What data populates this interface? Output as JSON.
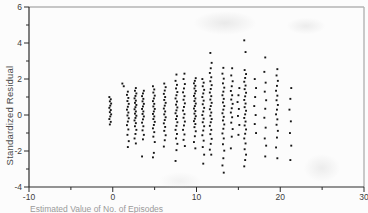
{
  "figure": {
    "bg": "#fcfcfc",
    "frame_color": "#b4b4b4",
    "axis_color": "#2a2a2a",
    "point_color": "#161616",
    "tick_label_color": "#3c3c3c"
  },
  "chart_data": {
    "type": "scatter",
    "title": "",
    "xlabel": "Estimated Value of No. of Episodes",
    "ylabel": "Standardized Residual",
    "xlim": [
      -10,
      30
    ],
    "ylim": [
      -4,
      6
    ],
    "x_major_ticks": [
      -10,
      0,
      10,
      20,
      30
    ],
    "x_minor_ticks": [
      -5,
      5,
      15,
      25
    ],
    "y_major_ticks": [
      6,
      4,
      2,
      0,
      -2,
      -4
    ],
    "y_minor_ticks": [
      5,
      3,
      1,
      -1,
      -3
    ],
    "grid": false,
    "legend": null,
    "marker": "square",
    "strips": [
      {
        "x": -0.3,
        "ys": [
          1.0,
          0.88,
          0.76,
          0.64,
          0.52,
          0.4,
          0.28,
          0.16,
          0.04,
          -0.08,
          -0.22,
          -0.38,
          -0.52
        ]
      },
      {
        "x": 1.2,
        "ys": [
          1.75,
          1.6
        ]
      },
      {
        "x": 1.8,
        "ys": [
          1.3,
          1.12,
          0.95,
          0.78,
          0.62,
          0.46,
          0.3,
          0.14,
          -0.02,
          -0.18,
          -0.36,
          -0.56,
          -0.8,
          -1.1,
          -1.45,
          -1.78
        ]
      },
      {
        "x": 2.7,
        "ys": [
          1.5,
          1.35,
          1.2,
          1.06,
          0.93,
          0.8,
          0.68,
          0.56,
          0.44,
          0.32,
          0.2,
          0.08,
          -0.04,
          -0.16,
          -0.3,
          -0.45,
          -0.62,
          -0.82,
          -1.05,
          -1.3,
          -1.58
        ]
      },
      {
        "x": 3.6,
        "ys": [
          1.35,
          1.2,
          1.05,
          0.9,
          0.76,
          0.62,
          0.48,
          0.34,
          0.2,
          0.06,
          -0.08,
          -0.24,
          -0.42,
          -0.62,
          -0.85,
          -1.1,
          -1.35,
          -2.3
        ]
      },
      {
        "x": 4.9,
        "ys": [
          1.6,
          1.42,
          1.25,
          1.08,
          0.92,
          0.77,
          0.62,
          0.48,
          0.34,
          0.2,
          0.06,
          -0.08,
          -0.22,
          -0.38,
          -0.55,
          -0.74,
          -0.95,
          -1.2,
          -1.5,
          -2.1,
          -2.35
        ]
      },
      {
        "x": 6.2,
        "ys": [
          1.75,
          1.55,
          1.36,
          1.18,
          1.0,
          0.84,
          0.68,
          0.52,
          0.36,
          0.2,
          0.04,
          -0.12,
          -0.28,
          -0.46,
          -0.66,
          -0.88,
          -1.12,
          -1.4,
          -1.75
        ]
      },
      {
        "x": 7.6,
        "ys": [
          2.25,
          1.9,
          1.68,
          1.48,
          1.28,
          1.1,
          0.92,
          0.75,
          0.58,
          0.42,
          0.26,
          0.1,
          -0.06,
          -0.22,
          -0.4,
          -0.6,
          -0.82,
          -1.05,
          -1.3,
          -1.6,
          -1.95,
          -2.55
        ]
      },
      {
        "x": 8.5,
        "ys": [
          2.3,
          2.0,
          1.72,
          1.48,
          1.26,
          1.05,
          0.85,
          0.65,
          0.45,
          0.25,
          0.05,
          -0.15,
          -0.36,
          -0.58,
          -0.82,
          -1.08,
          -1.38,
          -1.72
        ]
      },
      {
        "x": 9.8,
        "ys": [
          2.05,
          1.9,
          1.76,
          1.62,
          1.48,
          1.34,
          1.2,
          1.06,
          0.92,
          0.78,
          0.64,
          0.5,
          0.36,
          0.22,
          0.08,
          -0.06,
          -0.2,
          -0.34,
          -0.5,
          -0.67,
          -0.9,
          -1.18,
          -1.5,
          -1.85
        ]
      },
      {
        "x": 10.8,
        "ys": [
          2.0,
          1.8,
          1.6,
          1.4,
          1.2,
          1.0,
          0.8,
          0.6,
          0.4,
          0.2,
          0.0,
          -0.2,
          -0.4,
          -0.62,
          -0.86,
          -1.12,
          -1.42,
          -1.78,
          -2.2,
          -2.7
        ]
      },
      {
        "x": 11.7,
        "ys": [
          3.45,
          2.9,
          2.6,
          2.34,
          2.1,
          1.88,
          1.66,
          1.45,
          1.25,
          1.05,
          0.86,
          0.68,
          0.5,
          0.32,
          0.14,
          -0.04,
          -0.22,
          -0.4,
          -0.6,
          -0.82,
          -1.06,
          -1.32,
          -1.6,
          -1.92,
          -2.2
        ]
      },
      {
        "x": 13.2,
        "ys": [
          2.62,
          2.3,
          2.02,
          1.76,
          1.52,
          1.3,
          1.1,
          0.9,
          0.7,
          0.5,
          0.3,
          0.1,
          -0.1,
          -0.3,
          -0.52,
          -0.76,
          -1.02,
          -1.3,
          -1.62,
          -1.98,
          -2.4,
          -2.8,
          -3.2
        ]
      },
      {
        "x": 14.2,
        "ys": [
          2.6,
          2.2,
          1.88,
          1.6,
          1.34,
          1.1,
          0.86,
          0.62,
          0.38,
          0.14,
          -0.12,
          -0.42,
          -0.78,
          -1.2,
          -1.85
        ]
      },
      {
        "x": 15.0,
        "ys": [
          1.5,
          1.1,
          0.72,
          0.34,
          -0.05,
          -0.55,
          -1.1
        ]
      },
      {
        "x": 15.8,
        "ys": [
          4.15,
          3.5,
          2.5,
          2.28,
          2.06,
          1.85,
          1.64,
          1.44,
          1.24,
          1.04,
          0.84,
          0.64,
          0.44,
          0.24,
          0.04,
          -0.16,
          -0.36,
          -0.58,
          -0.8,
          -1.04,
          -1.3,
          -1.58,
          -1.9,
          -2.2,
          -2.5,
          -2.85
        ]
      },
      {
        "x": 17.0,
        "ys": [
          2.0,
          1.5,
          1.0,
          0.5,
          0.0,
          -0.5,
          -1.0
        ]
      },
      {
        "x": 18.2,
        "ys": [
          3.2,
          2.4,
          1.8,
          1.3,
          0.82,
          0.35,
          -0.15,
          -0.7,
          -1.3,
          -1.7,
          -2.3
        ]
      },
      {
        "x": 19.6,
        "ys": [
          2.55,
          2.2,
          1.9,
          1.62,
          1.35,
          1.08,
          0.82,
          0.56,
          0.3,
          0.04,
          -0.24,
          -0.54,
          -0.88,
          -1.25,
          -1.8,
          -2.4
        ]
      },
      {
        "x": 21.2,
        "ys": [
          1.5,
          0.9,
          0.3,
          -0.35,
          -1.0,
          -1.7,
          -2.5
        ]
      }
    ]
  }
}
